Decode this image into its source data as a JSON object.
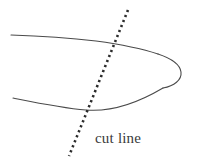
{
  "figure": {
    "background_color": "#ffffff",
    "width": 197,
    "height": 164,
    "outline": {
      "name": "tapered-appendage-outline",
      "stroke_color": "#4a4a4a",
      "stroke_width": 1.1,
      "description": "hand-drawn elongated shape, open at left, tapering to a rounded tip at right",
      "top_edge_path": "M 11 35 C 40 36, 70 38, 96 41 C 118 44, 140 48, 158 54",
      "tip_path": "M 158 54 C 170 58, 180 64, 181 72 C 182 80, 174 86, 163 88",
      "bottom_edge_path": "M 13 98 C 38 103, 62 108, 86 110 C 110 112, 136 104, 163 88"
    },
    "cut_line": {
      "name": "cut-line",
      "stroke_color": "#2b2b2b",
      "stroke_width": 2.6,
      "dash_pattern": "2.2 3.2",
      "start": {
        "x": 128,
        "y": 10
      },
      "end": {
        "x": 69,
        "y": 156
      },
      "intersections": [
        {
          "with": "top_edge",
          "x": 110,
          "y": 42
        },
        {
          "with": "bottom_edge",
          "x": 87,
          "y": 110
        }
      ]
    },
    "label": {
      "name": "cut-line-label",
      "text": "cut line",
      "color": "#3a3a3a",
      "font_size_px": 15,
      "x": 95,
      "y": 130
    }
  }
}
